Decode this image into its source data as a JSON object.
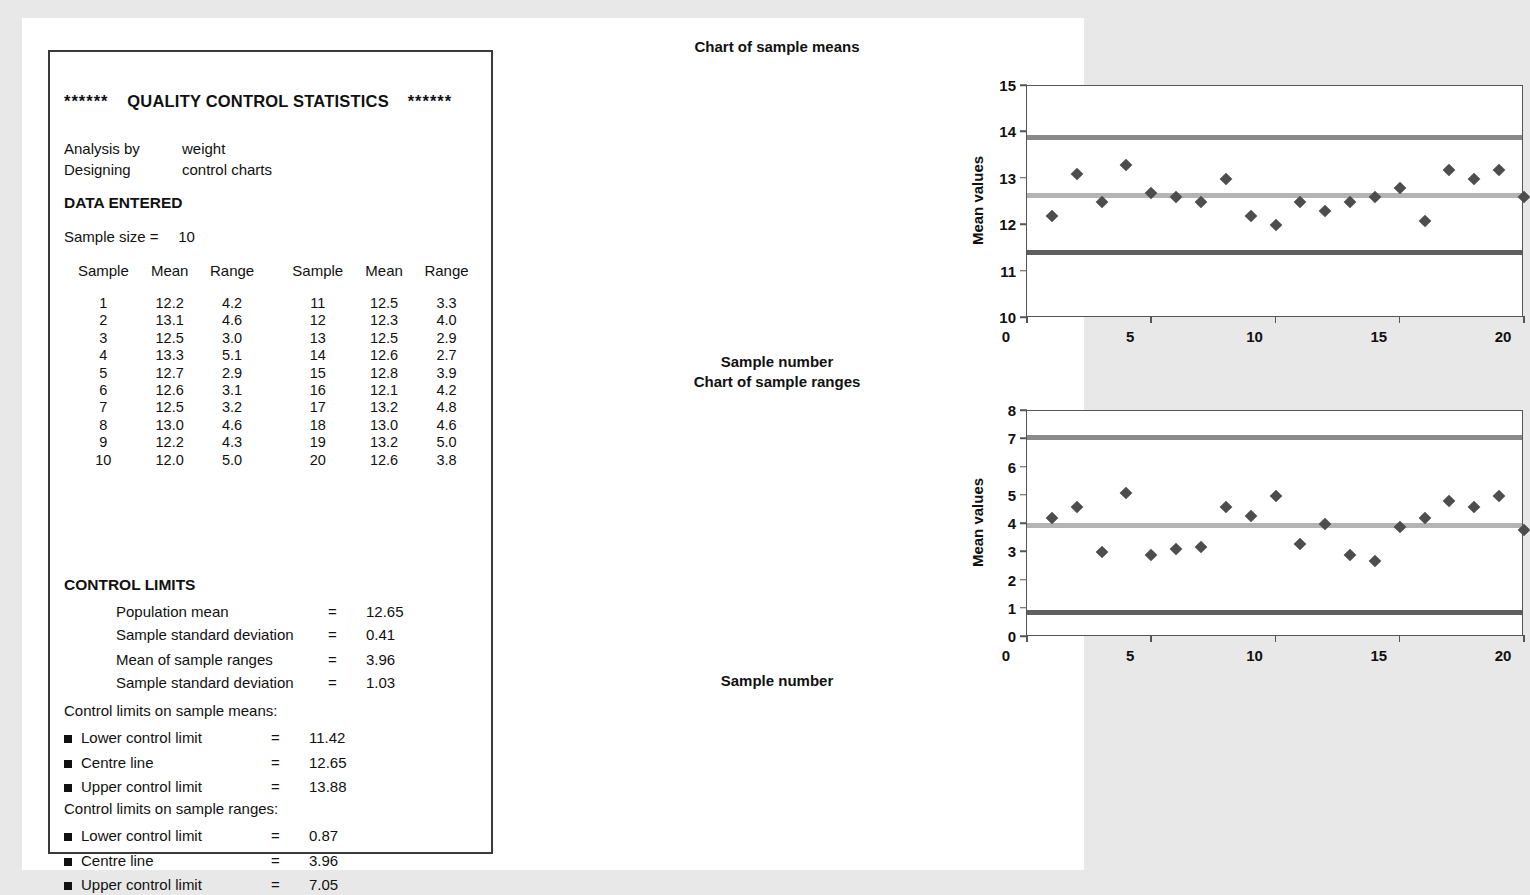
{
  "report": {
    "title": {
      "stars_left": "******",
      "main": "QUALITY CONTROL STATISTICS",
      "stars_right": "******"
    },
    "info": [
      {
        "key": "Analysis by",
        "value": "weight"
      },
      {
        "key": "Designing",
        "value": "control charts"
      }
    ],
    "data_entered_heading": "DATA ENTERED",
    "sample_size_label": "Sample size =",
    "sample_size_value": "10",
    "table_headers": [
      "Sample",
      "Mean",
      "Range",
      "Sample",
      "Mean",
      "Range"
    ],
    "table_rows": [
      [
        "1",
        "12.2",
        "4.2",
        "11",
        "12.5",
        "3.3"
      ],
      [
        "2",
        "13.1",
        "4.6",
        "12",
        "12.3",
        "4.0"
      ],
      [
        "3",
        "12.5",
        "3.0",
        "13",
        "12.5",
        "2.9"
      ],
      [
        "4",
        "13.3",
        "5.1",
        "14",
        "12.6",
        "2.7"
      ],
      [
        "5",
        "12.7",
        "2.9",
        "15",
        "12.8",
        "3.9"
      ],
      [
        "6",
        "12.6",
        "3.1",
        "16",
        "12.1",
        "4.2"
      ],
      [
        "7",
        "12.5",
        "3.2",
        "17",
        "13.2",
        "4.8"
      ],
      [
        "8",
        "13.0",
        "4.6",
        "18",
        "13.0",
        "4.6"
      ],
      [
        "9",
        "12.2",
        "4.3",
        "19",
        "13.2",
        "5.0"
      ],
      [
        "10",
        "12.0",
        "5.0",
        "20",
        "12.6",
        "3.8"
      ]
    ],
    "control_limits_heading": "CONTROL LIMITS",
    "stats_group_a": [
      {
        "label": "Population mean",
        "eq": "=",
        "value": "12.65"
      },
      {
        "label": "Sample standard deviation",
        "eq": "=",
        "value": "0.41"
      }
    ],
    "stats_group_b": [
      {
        "label": "Mean of sample ranges",
        "eq": "=",
        "value": "3.96"
      },
      {
        "label": "Sample standard deviation",
        "eq": "=",
        "value": "1.03"
      }
    ],
    "means_limits_heading": "Control limits on sample means:",
    "means_limits": [
      {
        "label": "Lower control limit",
        "eq": "=",
        "value": "11.42"
      },
      {
        "label": "Centre line",
        "eq": "=",
        "value": "12.65"
      },
      {
        "label": "Upper control limit",
        "eq": "=",
        "value": "13.88"
      }
    ],
    "ranges_limits_heading": "Control limits on sample ranges:",
    "ranges_limits": [
      {
        "label": "Lower control limit",
        "eq": "=",
        "value": "0.87"
      },
      {
        "label": "Centre line",
        "eq": "=",
        "value": "3.96"
      },
      {
        "label": "Upper control limit",
        "eq": "=",
        "value": "7.05"
      }
    ]
  },
  "colors": {
    "ucl_line": "#8a8a8a",
    "centre_line": "#b4b4b4",
    "lcl_line": "#5f5f5f",
    "marker": "#4d4d4d",
    "axis": "#555555",
    "page_background": "#ffffff",
    "canvas_background": "#e8e8e8",
    "box_border": "#3a3a3a"
  },
  "chart_data": [
    {
      "id": "means",
      "type": "scatter",
      "title": "Chart of sample means",
      "xlabel": "Sample number",
      "ylabel": "Mean values",
      "xlim": [
        0,
        20
      ],
      "ylim": [
        10,
        15
      ],
      "xticks": [
        0,
        5,
        10,
        15,
        20
      ],
      "yticks": [
        10,
        11,
        12,
        13,
        14,
        15
      ],
      "grid": false,
      "legend": null,
      "x": [
        1,
        2,
        3,
        4,
        5,
        6,
        7,
        8,
        9,
        10,
        11,
        12,
        13,
        14,
        15,
        16,
        17,
        18,
        19,
        20
      ],
      "values": [
        12.2,
        13.1,
        12.5,
        13.3,
        12.7,
        12.6,
        12.5,
        13.0,
        12.2,
        12.0,
        12.5,
        12.3,
        12.5,
        12.6,
        12.8,
        12.1,
        13.2,
        13.0,
        13.2,
        12.6
      ],
      "reference_lines": [
        {
          "name": "Upper control limit",
          "value": 13.88,
          "color": "#8a8a8a"
        },
        {
          "name": "Centre line",
          "value": 12.65,
          "color": "#b4b4b4"
        },
        {
          "name": "Lower control limit",
          "value": 11.42,
          "color": "#5f5f5f"
        }
      ]
    },
    {
      "id": "ranges",
      "type": "scatter",
      "title": "Chart of sample ranges",
      "xlabel": "Sample number",
      "ylabel": "Mean values",
      "xlim": [
        0,
        20
      ],
      "ylim": [
        0,
        8
      ],
      "xticks": [
        0,
        5,
        10,
        15,
        20
      ],
      "yticks": [
        0,
        1,
        2,
        3,
        4,
        5,
        6,
        7,
        8
      ],
      "grid": false,
      "legend": null,
      "x": [
        1,
        2,
        3,
        4,
        5,
        6,
        7,
        8,
        9,
        10,
        11,
        12,
        13,
        14,
        15,
        16,
        17,
        18,
        19,
        20
      ],
      "values": [
        4.2,
        4.6,
        3.0,
        5.1,
        2.9,
        3.1,
        3.2,
        4.6,
        4.3,
        5.0,
        3.3,
        4.0,
        2.9,
        2.7,
        3.9,
        4.2,
        4.8,
        4.6,
        5.0,
        3.8
      ],
      "reference_lines": [
        {
          "name": "Upper control limit",
          "value": 7.05,
          "color": "#8a8a8a"
        },
        {
          "name": "Centre line",
          "value": 3.96,
          "color": "#b4b4b4"
        },
        {
          "name": "Lower control limit",
          "value": 0.87,
          "color": "#5f5f5f"
        }
      ]
    }
  ]
}
